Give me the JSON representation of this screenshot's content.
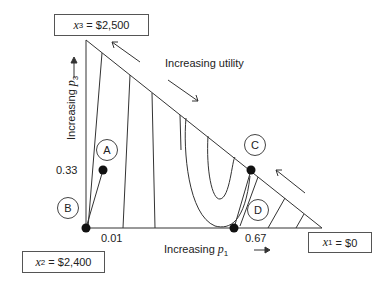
{
  "diagram": {
    "type": "probability-triangle",
    "outcome_boxes": {
      "top": {
        "var": "x",
        "sub": "3",
        "value": "= $2,500"
      },
      "bottom_left": {
        "var": "x",
        "sub": "2",
        "value": "= $2,400"
      },
      "bottom_right": {
        "var": "x",
        "sub": "1",
        "value": "= $0"
      }
    },
    "axis_labels": {
      "vertical": {
        "text": "Increasing ",
        "var": "p",
        "sub": "3"
      },
      "horizontal": {
        "text": "Increasing ",
        "var": "p",
        "sub": "1"
      }
    },
    "annotation": "Increasing utility",
    "tick_labels": {
      "y_033": "0.33",
      "x_001": "0.01",
      "x_067": "0.67"
    },
    "points": [
      {
        "label": "A"
      },
      {
        "label": "B"
      },
      {
        "label": "C"
      },
      {
        "label": "D"
      }
    ]
  }
}
